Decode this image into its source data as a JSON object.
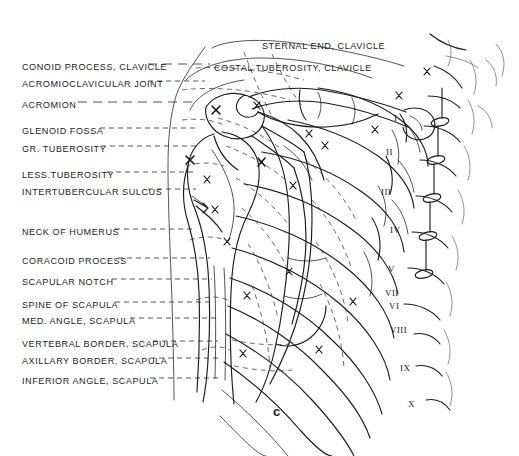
{
  "figure": {
    "caption": "c",
    "domain": "anatomical-line-drawing",
    "ink_color": "#1b1b1b",
    "background_color": "#ffffff",
    "width": 519,
    "height": 456
  },
  "labels_left": [
    {
      "id": "conoid-process-clavicle",
      "text": "CONOID PROCESS, CLAVICLE",
      "x": 22,
      "y": 63,
      "leader_from": 148,
      "leader_to": 210,
      "leader_y": 64,
      "dash": "long"
    },
    {
      "id": "acromioclavicular-joint",
      "text": "ACROMIOCLAVICULAR JOINT",
      "x": 22,
      "y": 80,
      "leader_from": 148,
      "leader_to": 205,
      "leader_y": 81,
      "dash": "short"
    },
    {
      "id": "acromion",
      "text": "ACROMION",
      "x": 22,
      "y": 101,
      "leader_from": 78,
      "leader_to": 196,
      "leader_y": 102,
      "dash": "long"
    },
    {
      "id": "glenoid-fossa",
      "text": "GLENOID FOSSA",
      "x": 22,
      "y": 127,
      "leader_from": 100,
      "leader_to": 196,
      "leader_y": 128,
      "dash": "short"
    },
    {
      "id": "gr-tuberosity",
      "text": "GR. TUBEROSITY",
      "x": 22,
      "y": 145,
      "leader_from": 101,
      "leader_to": 196,
      "leader_y": 146,
      "dash": "short"
    },
    {
      "id": "less-tuberosity",
      "text": "LESS.TUBEROSITY",
      "x": 22,
      "y": 171,
      "leader_from": 107,
      "leader_to": 196,
      "leader_y": 172,
      "dash": "short"
    },
    {
      "id": "intertubercular-sulcus",
      "text": "INTERTUBERCULAR SULCUS",
      "x": 22,
      "y": 188,
      "leader_from": 148,
      "leader_to": 196,
      "leader_y": 189,
      "dash": "short"
    },
    {
      "id": "neck-of-humerus",
      "text": "NECK OF HUMERUS",
      "x": 22,
      "y": 228,
      "leader_from": 115,
      "leader_to": 196,
      "leader_y": 229,
      "dash": "short"
    },
    {
      "id": "coracoid-process",
      "text": "CORACOID PROCESS",
      "x": 22,
      "y": 257,
      "leader_from": 118,
      "leader_to": 210,
      "leader_y": 258,
      "dash": "short"
    },
    {
      "id": "scapular-notch",
      "text": "SCAPULAR NOTCH",
      "x": 22,
      "y": 278,
      "leader_from": 112,
      "leader_to": 212,
      "leader_y": 279,
      "dash": "short"
    },
    {
      "id": "spine-of-scapula",
      "text": "SPINE OF SCAPULA",
      "x": 22,
      "y": 301,
      "leader_from": 115,
      "leader_to": 212,
      "leader_y": 302,
      "dash": "short"
    },
    {
      "id": "med-angle-scapula",
      "text": "MED. ANGLE, SCAPULA",
      "x": 22,
      "y": 317,
      "leader_from": 130,
      "leader_to": 218,
      "leader_y": 318,
      "dash": "short"
    },
    {
      "id": "vertebral-border-scapula",
      "text": "VERTEBRAL BORDER, SCAPULA",
      "x": 22,
      "y": 340,
      "leader_from": 153,
      "leader_to": 218,
      "leader_y": 341,
      "dash": "short"
    },
    {
      "id": "axillary-border-scapula",
      "text": "AXILLARY BORDER, SCAPULA",
      "x": 22,
      "y": 357,
      "leader_from": 150,
      "leader_to": 220,
      "leader_y": 358,
      "dash": "short"
    },
    {
      "id": "inferior-angle-scapula",
      "text": "INFERIOR ANGLE, SCAPULA",
      "x": 22,
      "y": 377,
      "leader_from": 150,
      "leader_to": 222,
      "leader_y": 378,
      "dash": "short"
    }
  ],
  "labels_top": [
    {
      "id": "sternal-end-clavicle",
      "text": "STERNAL END, CLAVICLE",
      "x": 262,
      "y": 42
    },
    {
      "id": "costal-tuberosity-clavicle",
      "text": "COSTAL TUBEROSITY, CLAVICLE",
      "x": 214,
      "y": 64
    }
  ],
  "rib_numbers": [
    {
      "id": "rib-1",
      "text": "I",
      "x": 394,
      "y": 113
    },
    {
      "id": "rib-2",
      "text": "II",
      "x": 386,
      "y": 147
    },
    {
      "id": "rib-3",
      "text": "III",
      "x": 381,
      "y": 187
    },
    {
      "id": "rib-4",
      "text": "IV",
      "x": 390,
      "y": 225
    },
    {
      "id": "rib-5",
      "text": "V",
      "x": 388,
      "y": 264
    },
    {
      "id": "rib-6",
      "text": "VI",
      "x": 389,
      "y": 301
    },
    {
      "id": "rib-7",
      "text": "VII",
      "x": 385,
      "y": 288
    },
    {
      "id": "rib-8",
      "text": "VIII",
      "x": 390,
      "y": 325
    },
    {
      "id": "rib-9",
      "text": "IX",
      "x": 400,
      "y": 363
    },
    {
      "id": "rib-10",
      "text": "X",
      "x": 408,
      "y": 399
    }
  ]
}
